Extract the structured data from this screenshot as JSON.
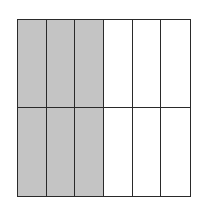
{
  "diagram": {
    "type": "fraction-grid",
    "rows": 2,
    "columns": 6,
    "total_parts": 12,
    "shaded_parts": 6,
    "shaded_columns": [
      0,
      1,
      2
    ],
    "colors": {
      "shaded": "#c4c4c4",
      "unshaded": "#ffffff",
      "border": "#2a2a2a"
    }
  }
}
